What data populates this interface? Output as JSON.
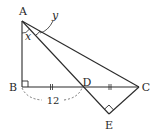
{
  "diagram": {
    "type": "geometry",
    "colors": {
      "stroke": "#2a2a2a",
      "background": "#ffffff",
      "dashed": "#555555"
    },
    "points": {
      "A": {
        "label": "A",
        "x": 22,
        "y": 21
      },
      "B": {
        "label": "B",
        "x": 22,
        "y": 87
      },
      "D": {
        "label": "D",
        "x": 82,
        "y": 87
      },
      "C": {
        "label": "C",
        "x": 139,
        "y": 87
      },
      "E": {
        "label": "E",
        "x": 109,
        "y": 114
      }
    },
    "angles": {
      "x": {
        "label": "x",
        "at": "A",
        "between": "AB, AD"
      },
      "y": {
        "label": "y",
        "at": "A",
        "between": "AD, AC"
      }
    },
    "right_angles": [
      "B",
      "E"
    ],
    "equal_marks": [
      "BD",
      "DC"
    ],
    "measurements": {
      "BD": "12"
    },
    "segments": [
      "AB",
      "BC",
      "AC",
      "AE",
      "EC"
    ]
  }
}
